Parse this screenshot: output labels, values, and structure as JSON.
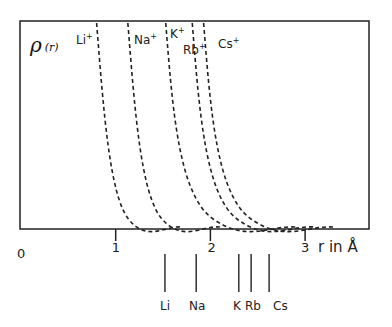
{
  "chart_data": {
    "type": "line",
    "title": "",
    "ylabel": "ρ(r)",
    "xlabel": "r in Å",
    "xlim": [
      0,
      3.6
    ],
    "x_ticks": [
      {
        "value": 0,
        "label": "0"
      },
      {
        "value": 1,
        "label": "1"
      },
      {
        "value": 2,
        "label": "2"
      },
      {
        "value": 3,
        "label": "3"
      }
    ],
    "grid": false,
    "line_style": "dashed",
    "series": [
      {
        "name": "Li+",
        "label": "Li⁺",
        "r_start": 0.83,
        "r_end": 1.7
      },
      {
        "name": "Na+",
        "label": "Na⁺",
        "r_start": 1.16,
        "r_end": 2.1
      },
      {
        "name": "K+",
        "label": "K⁺",
        "r_start": 1.56,
        "r_end": 2.9
      },
      {
        "name": "Rb+",
        "label": "Rb⁺",
        "r_start": 1.84,
        "r_end": 3.1
      },
      {
        "name": "Cs+",
        "label": "Cs⁺",
        "r_start": 1.96,
        "r_end": 3.3
      }
    ],
    "reference_markers": [
      {
        "label": "Li",
        "r": 1.52
      },
      {
        "label": "Na",
        "r": 1.85
      },
      {
        "label": "K",
        "r": 2.3
      },
      {
        "label": "Rb",
        "r": 2.43
      },
      {
        "label": "Cs",
        "r": 2.62
      }
    ]
  }
}
